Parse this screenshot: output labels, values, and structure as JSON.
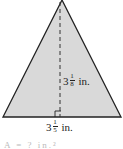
{
  "figure": {
    "shape": "triangle",
    "fill_color": "#d9d9d9",
    "stroke_color": "#222222",
    "height_label": {
      "whole": "3",
      "numerator": "1",
      "denominator": "8",
      "unit": "in."
    },
    "base_label": {
      "whole": "3",
      "numerator": "1",
      "denominator": "5",
      "unit": "in."
    },
    "cut_off_text": "A = ? in.²"
  }
}
